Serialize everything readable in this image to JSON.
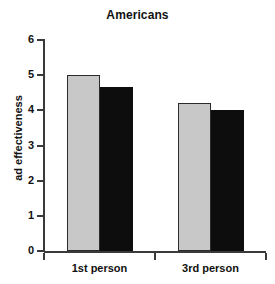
{
  "chart_data": {
    "type": "bar",
    "title": "Americans",
    "xlabel": "",
    "ylabel": "ad effectiveness",
    "categories": [
      "1st person",
      "3rd person"
    ],
    "series": [
      {
        "name": "light-gray-series",
        "color": "#c8c8c8",
        "values": [
          5.0,
          4.2
        ]
      },
      {
        "name": "black-series",
        "color": "#0d0d0d",
        "values": [
          4.65,
          4.0
        ]
      }
    ],
    "ylim": [
      0,
      6
    ],
    "ytick_labels": [
      "0",
      "1",
      "2",
      "3",
      "4",
      "5",
      "6"
    ],
    "ytick_values": [
      0,
      1,
      2,
      3,
      4,
      5,
      6
    ],
    "grid": false,
    "legend": false,
    "legend_position": "none"
  },
  "colors": {
    "axis": "#3a3a3a",
    "text": "#111111",
    "background": "#ffffff",
    "bar_light": "#c8c8c8",
    "bar_dark": "#0d0d0d"
  }
}
